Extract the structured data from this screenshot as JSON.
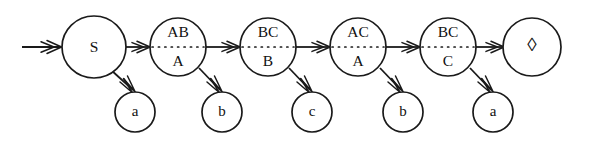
{
  "diagram": {
    "type": "pushdown-transducer-trace",
    "background_color": "#ffffff",
    "ink_color": "#1a1a1a",
    "start_arrow": {
      "name": "start-arrow",
      "label": ""
    },
    "states": [
      {
        "id": "s0",
        "name": "state-s",
        "cx": 94,
        "cy": 47,
        "r": 31,
        "divided": false,
        "top_label": "S",
        "bottom_label": "",
        "single_label": "S"
      },
      {
        "id": "s1",
        "name": "state-ab-a",
        "cx": 178,
        "cy": 47,
        "r": 28,
        "divided": true,
        "top_label": "AB",
        "bottom_label": "A",
        "single_label": ""
      },
      {
        "id": "s2",
        "name": "state-bc-b",
        "cx": 268,
        "cy": 47,
        "r": 28,
        "divided": true,
        "top_label": "BC",
        "bottom_label": "B",
        "single_label": ""
      },
      {
        "id": "s3",
        "name": "state-ac-a",
        "cx": 358,
        "cy": 47,
        "r": 28,
        "divided": true,
        "top_label": "AC",
        "bottom_label": "A",
        "single_label": ""
      },
      {
        "id": "s4",
        "name": "state-bc-c",
        "cx": 448,
        "cy": 47,
        "r": 28,
        "divided": true,
        "top_label": "BC",
        "bottom_label": "C",
        "single_label": ""
      },
      {
        "id": "s5",
        "name": "state-final-empty",
        "cx": 532,
        "cy": 47,
        "r": 28,
        "divided": false,
        "top_label": "◊",
        "bottom_label": "",
        "single_label": "◊"
      }
    ],
    "outputs": [
      {
        "id": "o0",
        "name": "output-node-a",
        "label": "a",
        "cx": 135,
        "cy": 112,
        "r": 20,
        "from": "s0"
      },
      {
        "id": "o1",
        "name": "output-node-b",
        "label": "b",
        "cx": 222,
        "cy": 112,
        "r": 20,
        "from": "s1"
      },
      {
        "id": "o2",
        "name": "output-node-c",
        "label": "c",
        "cx": 312,
        "cy": 112,
        "r": 20,
        "from": "s2"
      },
      {
        "id": "o3",
        "name": "output-node-b-2",
        "label": "b",
        "cx": 403,
        "cy": 112,
        "r": 20,
        "from": "s3"
      },
      {
        "id": "o4",
        "name": "output-node-a-2",
        "label": "a",
        "cx": 493,
        "cy": 112,
        "r": 20,
        "from": "s4"
      }
    ],
    "output_sequence": "abcba",
    "transitions": [
      {
        "name": "transition-s-to-ab",
        "from": "s0",
        "to": "s1"
      },
      {
        "name": "transition-ab-to-bc",
        "from": "s1",
        "to": "s2"
      },
      {
        "name": "transition-bc-to-ac",
        "from": "s2",
        "to": "s3"
      },
      {
        "name": "transition-ac-to-bc",
        "from": "s3",
        "to": "s4"
      },
      {
        "name": "transition-bc-to-final",
        "from": "s4",
        "to": "s5"
      }
    ]
  }
}
